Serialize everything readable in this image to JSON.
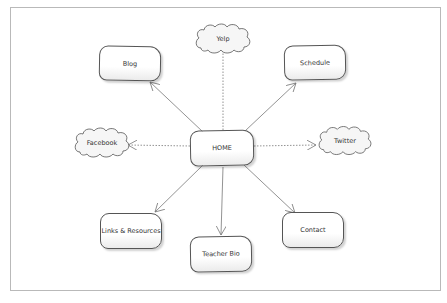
{
  "diagram": {
    "type": "site map",
    "center": {
      "id": "home",
      "label": "HOME"
    },
    "nodes": [
      {
        "id": "blog",
        "label": "Blog",
        "shape": "box"
      },
      {
        "id": "yelp",
        "label": "Yelp",
        "shape": "cloud"
      },
      {
        "id": "schedule",
        "label": "Schedule",
        "shape": "box"
      },
      {
        "id": "facebook",
        "label": "Facebook",
        "shape": "cloud"
      },
      {
        "id": "twitter",
        "label": "Twitter",
        "shape": "cloud"
      },
      {
        "id": "links",
        "label": "Links & Resources",
        "shape": "box"
      },
      {
        "id": "teacher-bio",
        "label": "Teacher Bio",
        "shape": "box"
      },
      {
        "id": "contact",
        "label": "Contact",
        "shape": "box"
      }
    ],
    "edges": [
      {
        "from": "home",
        "to": "blog",
        "style": "solid"
      },
      {
        "from": "home",
        "to": "yelp",
        "style": "dotted"
      },
      {
        "from": "home",
        "to": "schedule",
        "style": "solid"
      },
      {
        "from": "home",
        "to": "facebook",
        "style": "dotted"
      },
      {
        "from": "home",
        "to": "twitter",
        "style": "dotted"
      },
      {
        "from": "home",
        "to": "links",
        "style": "solid"
      },
      {
        "from": "home",
        "to": "teacher-bio",
        "style": "solid"
      },
      {
        "from": "home",
        "to": "contact",
        "style": "solid"
      }
    ]
  }
}
